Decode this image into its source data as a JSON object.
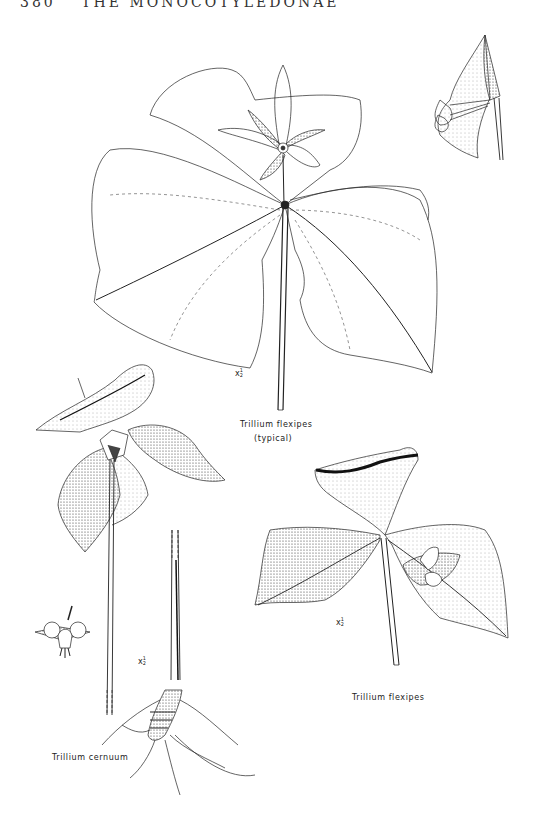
{
  "header": {
    "page_number": "380",
    "running_title": "THE MONOCOTYLEDONAE"
  },
  "figures": [
    {
      "id": "trillium-flexipes-typical",
      "caption_line1": "Trillium flexipes",
      "caption_line2": "(typical)",
      "scale": "x",
      "scale_fraction_num": "1",
      "scale_fraction_den": "2"
    },
    {
      "id": "trillium-flexipes",
      "caption_line1": "Trillium flexipes",
      "scale": "x",
      "scale_fraction_num": "1",
      "scale_fraction_den": "2"
    },
    {
      "id": "trillium-cernuum",
      "caption_line1": "Trillium cernuum",
      "scale": "x",
      "scale_fraction_num": "1",
      "scale_fraction_den": "2"
    }
  ],
  "colors": {
    "ink": "#1a1a1a",
    "paper": "#ffffff",
    "stipple": "#555555"
  }
}
